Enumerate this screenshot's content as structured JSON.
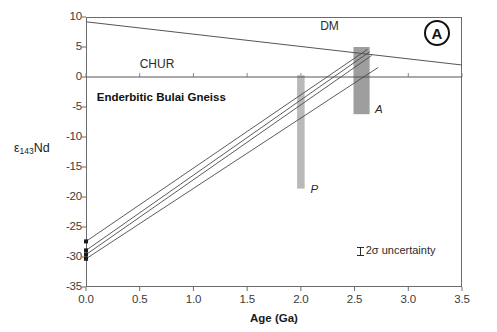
{
  "figure": {
    "panel_label": "A",
    "background_color": "#ffffff",
    "frame_color": "#6b6b6b"
  },
  "chart_data": {
    "type": "line",
    "title": "",
    "xlabel": "Age (Ga)",
    "ylabel": "ε143Nd",
    "ylabel_main": "ε",
    "ylabel_sub": "143",
    "ylabel_tail": "Nd",
    "xlim": [
      0.0,
      3.5
    ],
    "ylim": [
      -35,
      10
    ],
    "grid": false,
    "legend": "none",
    "xticks": [
      0.0,
      0.5,
      1.0,
      1.5,
      2.0,
      2.5,
      3.0,
      3.5
    ],
    "xtick_labels": [
      "0.0",
      "0.5",
      "1.0",
      "1.5",
      "2.0",
      "2.5",
      "3.0",
      "3.5"
    ],
    "yticks": [
      10,
      5,
      0,
      -5,
      -10,
      -15,
      -20,
      -25,
      -30,
      -35
    ],
    "ytick_labels": [
      "10",
      "5",
      "0",
      "-5",
      "-10",
      "-15",
      "-20",
      "-25",
      "-30",
      "-35"
    ],
    "series": [
      {
        "name": "DM",
        "kind": "reference-line",
        "color": "#555555",
        "points": [
          [
            0.0,
            9.2
          ],
          [
            3.5,
            2.0
          ]
        ]
      },
      {
        "name": "CHUR",
        "kind": "reference-line",
        "color": "#555555",
        "points": [
          [
            0.0,
            0.0
          ],
          [
            3.5,
            0.0
          ]
        ]
      },
      {
        "name": "sample-evolution-1",
        "kind": "evolution-line",
        "color": "#4a4a4a",
        "points": [
          [
            0.0,
            -27.4
          ],
          [
            2.62,
            4.6
          ]
        ]
      },
      {
        "name": "sample-evolution-2",
        "kind": "evolution-line",
        "color": "#4a4a4a",
        "points": [
          [
            0.0,
            -28.9
          ],
          [
            2.64,
            4.2
          ]
        ]
      },
      {
        "name": "sample-evolution-3",
        "kind": "evolution-line",
        "color": "#4a4a4a",
        "points": [
          [
            0.0,
            -29.6
          ],
          [
            2.66,
            3.6
          ]
        ]
      },
      {
        "name": "sample-evolution-4",
        "kind": "evolution-line",
        "color": "#4a4a4a",
        "points": [
          [
            0.0,
            -30.3
          ],
          [
            2.72,
            1.6
          ]
        ]
      }
    ],
    "data_points": [
      {
        "x": 0.0,
        "y": -27.4
      },
      {
        "x": 0.0,
        "y": -28.9
      },
      {
        "x": 0.0,
        "y": -29.6
      },
      {
        "x": 0.0,
        "y": -30.3
      }
    ],
    "bars": [
      {
        "name": "P",
        "label": "P",
        "x": 2.0,
        "x_width": 0.035,
        "y_top": 0.3,
        "y_bottom": -18.6,
        "color": "#b9b9b9"
      },
      {
        "name": "A",
        "label": "A",
        "x": 2.565,
        "x_width": 0.075,
        "y_top": 5.0,
        "y_bottom": -6.2,
        "color": "#9e9e9e"
      }
    ],
    "annotations": [
      {
        "name": "dm-label",
        "text": "DM",
        "x": 2.18,
        "y": 8.3
      },
      {
        "name": "chur-label",
        "text": "CHUR",
        "x": 0.5,
        "y": 2.0
      },
      {
        "name": "unit-label",
        "text": "Enderbitic Bulai Gneiss",
        "x": 0.1,
        "y": -3.6
      },
      {
        "name": "p-label",
        "text": "P",
        "x": 2.09,
        "y": -19.0
      },
      {
        "name": "a-label",
        "text": "A",
        "x": 2.69,
        "y": -5.6
      },
      {
        "name": "uncertainty-label",
        "text": "2σ uncertainty",
        "x": 2.52,
        "y": -29.2
      }
    ]
  }
}
